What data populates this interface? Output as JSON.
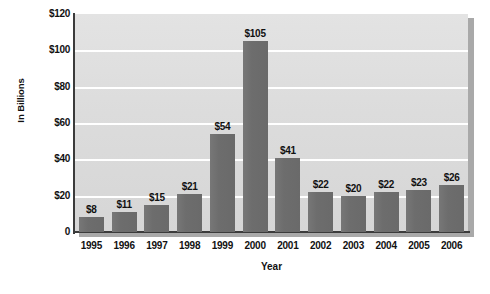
{
  "chart_data": {
    "type": "bar",
    "title": "",
    "xlabel": "Year",
    "ylabel": "In Billions",
    "categories": [
      "1995",
      "1996",
      "1997",
      "1998",
      "1999",
      "2000",
      "2001",
      "2002",
      "2003",
      "2004",
      "2005",
      "2006"
    ],
    "values": [
      8,
      11,
      15,
      21,
      54,
      105,
      41,
      22,
      20,
      22,
      23,
      26
    ],
    "value_labels": [
      "$8",
      "$11",
      "$15",
      "$21",
      "$54",
      "$105",
      "$41",
      "$22",
      "$20",
      "$22",
      "$23",
      "$26"
    ],
    "ylim": [
      0,
      120
    ],
    "y_ticks": [
      0,
      20,
      40,
      60,
      80,
      100,
      120
    ],
    "y_tick_labels": [
      "0",
      "$20",
      "$40",
      "$60",
      "$80",
      "$100",
      "$120"
    ],
    "grid": true,
    "grid_axis": "y",
    "legend": false,
    "bar_color": "#6d6d6d",
    "plot_background": "#dcdcdc",
    "gridline_color": "#ffffff",
    "axis_color": "#3b3b3b",
    "page_background": "#ffffff"
  }
}
